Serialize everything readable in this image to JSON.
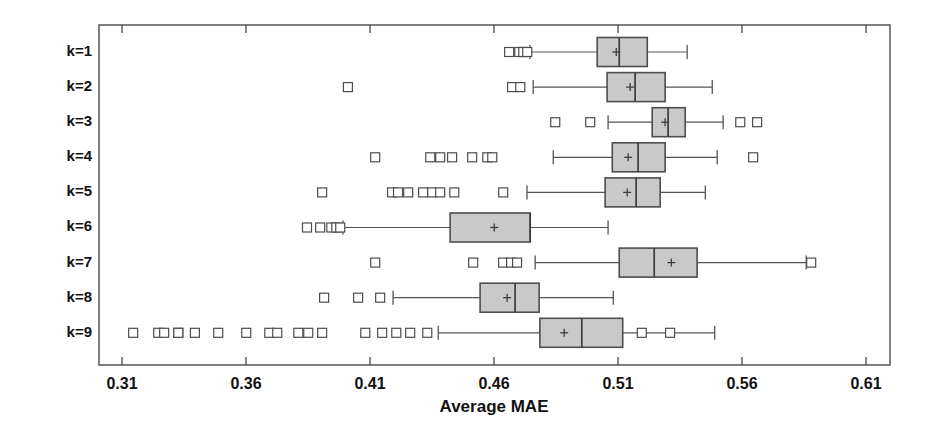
{
  "chart_data": {
    "type": "box",
    "title": "",
    "xlabel": "Average MAE",
    "ylabel": "",
    "xlim": [
      0.295,
      0.6253
    ],
    "xticks": [
      0.31,
      0.36,
      0.41,
      0.46,
      0.51,
      0.56,
      0.61
    ],
    "xtick_labels": [
      "0.31",
      "0.36",
      "0.41",
      "0.46",
      "0.51",
      "0.56",
      "0.61"
    ],
    "categories": [
      "k=1",
      "k=2",
      "k=3",
      "k=4",
      "k=5",
      "k=6",
      "k=7",
      "k=8",
      "k=9"
    ],
    "orientation": "horizontal",
    "grid": false,
    "legend": null,
    "box_fill": "#c9c9c9",
    "box_edge": "#4d4d4d",
    "mean_marker": "+",
    "boxes": [
      {
        "label": "k=1",
        "whisker_low": 0.4745,
        "q1": 0.5016,
        "median": 0.5105,
        "q3": 0.5218,
        "whisker_high": 0.5379,
        "mean": 0.5093,
        "outliers": [
          0.4661,
          0.4702,
          0.4718,
          0.4734
        ]
      },
      {
        "label": "k=2",
        "whisker_low": 0.4758,
        "q1": 0.5056,
        "median": 0.5169,
        "q3": 0.529,
        "whisker_high": 0.548,
        "mean": 0.5149,
        "outliers": [
          0.4011,
          0.4673,
          0.4706
        ]
      },
      {
        "label": "k=3",
        "whisker_low": 0.506,
        "q1": 0.5238,
        "median": 0.5302,
        "q3": 0.5371,
        "whisker_high": 0.5524,
        "mean": 0.529,
        "outliers": [
          0.4847,
          0.4988,
          0.5593,
          0.5661
        ]
      },
      {
        "label": "k=4",
        "whisker_low": 0.4839,
        "q1": 0.5077,
        "median": 0.5181,
        "q3": 0.529,
        "whisker_high": 0.55,
        "mean": 0.5141,
        "outliers": [
          0.4121,
          0.4343,
          0.4383,
          0.4431,
          0.4512,
          0.4573,
          0.4593,
          0.5645
        ]
      },
      {
        "label": "k=5",
        "whisker_low": 0.4733,
        "q1": 0.5048,
        "median": 0.5173,
        "q3": 0.527,
        "whisker_high": 0.5452,
        "mean": 0.5137,
        "outliers": [
          0.3907,
          0.4189,
          0.4213,
          0.4254,
          0.4314,
          0.4351,
          0.4383,
          0.444,
          0.4637
        ]
      },
      {
        "label": "k=6",
        "whisker_low": 0.3991,
        "q1": 0.4423,
        "median": 0.4746,
        "q3": 0.4746,
        "whisker_high": 0.506,
        "mean": 0.4601,
        "outliers": [
          0.3846,
          0.3899,
          0.3944,
          0.3964,
          0.398
        ]
      },
      {
        "label": "k=7",
        "whisker_low": 0.4766,
        "q1": 0.5105,
        "median": 0.5246,
        "q3": 0.5419,
        "whisker_high": 0.5859,
        "mean": 0.5315,
        "outliers": [
          0.4121,
          0.4516,
          0.4637,
          0.4669,
          0.4693,
          0.5879
        ]
      },
      {
        "label": "k=8",
        "whisker_low": 0.4193,
        "q1": 0.4544,
        "median": 0.4685,
        "q3": 0.4782,
        "whisker_high": 0.5081,
        "mean": 0.4653,
        "outliers": [
          0.3915,
          0.4052,
          0.4141
        ]
      },
      {
        "label": "k=9",
        "whisker_low": 0.4375,
        "q1": 0.4785,
        "median": 0.4954,
        "q3": 0.5119,
        "whisker_high": 0.549,
        "mean": 0.4883,
        "outliers": [
          0.3145,
          0.3246,
          0.327,
          0.3327,
          0.3327,
          0.3394,
          0.3488,
          0.3601,
          0.3694,
          0.3726,
          0.3811,
          0.3851,
          0.3907,
          0.4081,
          0.4149,
          0.4206,
          0.4262,
          0.4331,
          0.5196,
          0.531
        ]
      }
    ]
  },
  "axes": {
    "x_title": "Average MAE"
  }
}
